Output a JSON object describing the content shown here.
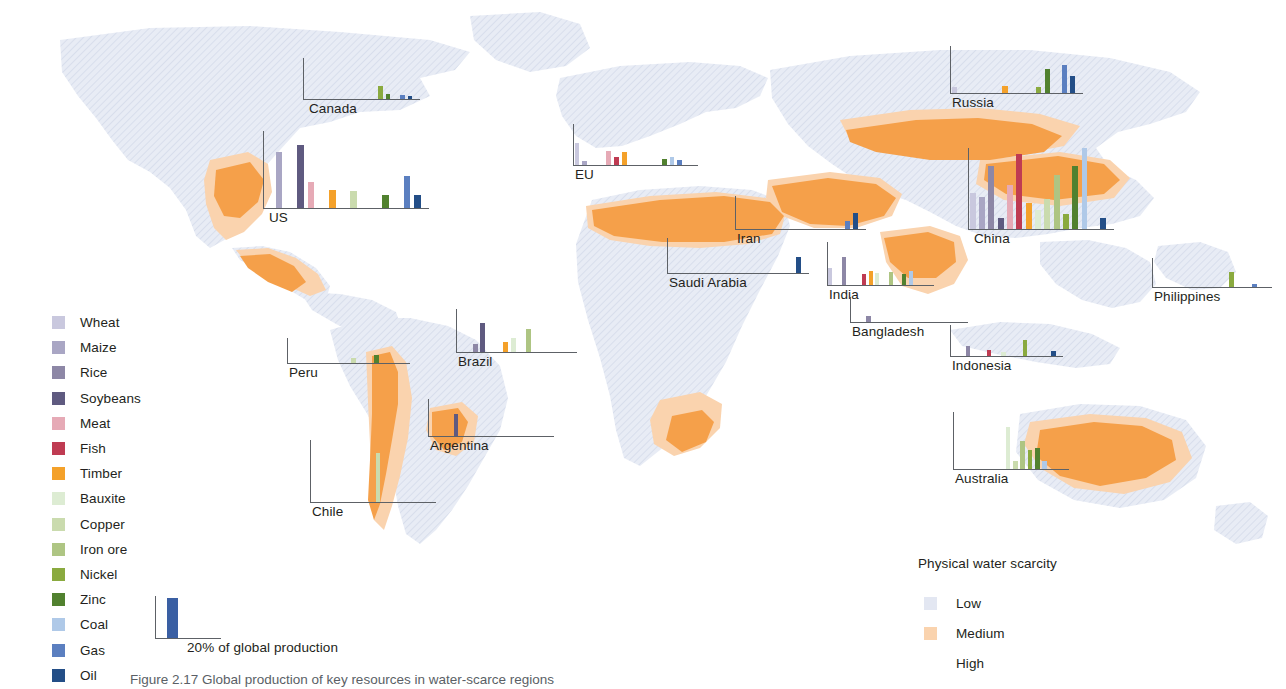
{
  "figure": {
    "caption": "Figure 2.17 Global production of key resources in water-scarce regions",
    "scale_key": {
      "label": "20% of global production",
      "bar_color": "#3a5fa3",
      "value_pct": 20
    }
  },
  "legend_products": {
    "items": [
      {
        "label": "Wheat",
        "color": "#c9c8de"
      },
      {
        "label": "Maize",
        "color": "#a9a6c4"
      },
      {
        "label": "Rice",
        "color": "#8d87a6"
      },
      {
        "label": "Soybeans",
        "color": "#5f5a80"
      },
      {
        "label": "Meat",
        "color": "#e6aab6"
      },
      {
        "label": "Fish",
        "color": "#bf3b52"
      },
      {
        "label": "Timber",
        "color": "#f4a12a"
      },
      {
        "label": "Bauxite",
        "color": "#ddecd3"
      },
      {
        "label": "Copper",
        "color": "#cadbae"
      },
      {
        "label": "Iron ore",
        "color": "#aec583"
      },
      {
        "label": "Nickel",
        "color": "#8aaa3f"
      },
      {
        "label": "Zinc",
        "color": "#51812f"
      },
      {
        "label": "Coal",
        "color": "#afc9e8"
      },
      {
        "label": "Gas",
        "color": "#5b7fc0"
      },
      {
        "label": "Oil",
        "color": "#234e87"
      }
    ]
  },
  "legend_water": {
    "title": "Physical water scarcity",
    "items": [
      {
        "label": "Low",
        "color": "#e3e7f2"
      },
      {
        "label": "Medium",
        "color": "#fad3ae"
      },
      {
        "label": "High",
        "color": "#f5a council"
      }
    ]
  },
  "chart_data": {
    "type": "bar",
    "title": "Global production of key resources in water-scarce regions",
    "unit": "% of global production",
    "categories": [
      "Wheat",
      "Maize",
      "Rice",
      "Soybeans",
      "Meat",
      "Fish",
      "Timber",
      "Bauxite",
      "Copper",
      "Iron ore",
      "Nickel",
      "Zinc",
      "Coal",
      "Gas",
      "Oil"
    ],
    "category_colors": [
      "#c9c8de",
      "#a9a6c4",
      "#8d87a6",
      "#5f5a80",
      "#e6aab6",
      "#bf3b52",
      "#f4a12a",
      "#ddecd3",
      "#cadbae",
      "#aec583",
      "#8aaa3f",
      "#51812f",
      "#afc9e8",
      "#5b7fc0",
      "#234e87"
    ],
    "ylim": [
      0,
      40
    ],
    "scale_reference_pct": 20,
    "panels": [
      {
        "name": "Canada",
        "label": "Canada",
        "x": 303,
        "y": 58,
        "w": 117,
        "h": 42,
        "label_x": 6,
        "label_y": 43,
        "values": [
          0,
          0,
          0,
          0,
          0,
          0,
          0,
          0,
          0,
          0,
          13,
          6,
          0,
          4.5,
          4
        ]
      },
      {
        "name": "US",
        "label": "US",
        "x": 263,
        "y": 131,
        "w": 166,
        "h": 78,
        "label_x": 6,
        "label_y": 79,
        "values": [
          0,
          29,
          0,
          33,
          14,
          0,
          10,
          0,
          9,
          0,
          0,
          7,
          0,
          17,
          7
        ]
      },
      {
        "name": "EU",
        "label": "EU",
        "x": 573,
        "y": 124,
        "w": 125,
        "h": 42,
        "label_x": 2,
        "label_y": 43,
        "values": [
          22,
          5,
          0,
          0,
          14,
          9,
          13,
          0,
          0,
          0,
          0,
          7,
          9,
          6,
          0
        ]
      },
      {
        "name": "Russia",
        "label": "Russia",
        "x": 950,
        "y": 46,
        "w": 133,
        "h": 48,
        "label_x": 2,
        "label_y": 49,
        "values": [
          6,
          0,
          0,
          0,
          0,
          0,
          7,
          0,
          0,
          0,
          6,
          21,
          0,
          24,
          15
        ]
      },
      {
        "name": "China",
        "label": "China",
        "x": 968,
        "y": 148,
        "w": 146,
        "h": 82,
        "label_x": 6,
        "label_y": 83,
        "values": [
          18,
          16,
          31,
          6,
          22,
          37,
          13,
          10,
          15,
          27,
          8,
          31,
          40,
          0,
          6
        ]
      },
      {
        "name": "Iran",
        "label": "Iran",
        "x": 735,
        "y": 196,
        "w": 131,
        "h": 34,
        "label_x": 2,
        "label_y": 35,
        "values": [
          0,
          0,
          0,
          0,
          0,
          0,
          0,
          0,
          0,
          0,
          0,
          0,
          0,
          11,
          20
        ]
      },
      {
        "name": "Saudi Arabia",
        "label": "Saudi Arabia",
        "x": 667,
        "y": 238,
        "w": 142,
        "h": 36,
        "label_x": 2,
        "label_y": 37,
        "values": [
          0,
          0,
          0,
          0,
          0,
          0,
          0,
          0,
          0,
          0,
          0,
          0,
          0,
          0,
          19
        ]
      },
      {
        "name": "India",
        "label": "India",
        "x": 827,
        "y": 242,
        "w": 107,
        "h": 44,
        "label_x": 2,
        "label_y": 45,
        "values": [
          16,
          0,
          26,
          0,
          0,
          11,
          14,
          12,
          0,
          13,
          0,
          11,
          14,
          0,
          0
        ]
      },
      {
        "name": "Bangladesh",
        "label": "Bangladesh",
        "x": 850,
        "y": 297,
        "w": 118,
        "h": 26,
        "label_x": 2,
        "label_y": 27,
        "values": [
          0,
          0,
          11,
          0,
          0,
          0,
          0,
          0,
          0,
          0,
          0,
          0,
          0,
          0,
          0
        ]
      },
      {
        "name": "Philippines",
        "label": "Philippines",
        "x": 1152,
        "y": 258,
        "w": 120,
        "h": 30,
        "label_x": 2,
        "label_y": 31,
        "values": [
          0,
          0,
          0,
          0,
          0,
          0,
          0,
          0,
          0,
          0,
          21,
          0,
          0,
          6,
          0
        ]
      },
      {
        "name": "Indonesia",
        "label": "Indonesia",
        "x": 950,
        "y": 325,
        "w": 113,
        "h": 32,
        "label_x": 2,
        "label_y": 33,
        "values": [
          0,
          0,
          14,
          0,
          0,
          9,
          0,
          6,
          0,
          0,
          21,
          0,
          0,
          0,
          7
        ]
      },
      {
        "name": "Peru",
        "label": "Peru",
        "x": 287,
        "y": 338,
        "w": 123,
        "h": 26,
        "label_x": 2,
        "label_y": 27,
        "values": [
          0,
          0,
          0,
          0,
          0,
          0,
          0,
          0,
          10,
          0,
          0,
          14,
          0,
          0,
          0
        ]
      },
      {
        "name": "Brazil",
        "label": "Brazil",
        "x": 456,
        "y": 309,
        "w": 121,
        "h": 44,
        "label_x": 2,
        "label_y": 45,
        "values": [
          0,
          0,
          8,
          27,
          0,
          0,
          10,
          14,
          0,
          22,
          0,
          0,
          0,
          0,
          0
        ]
      },
      {
        "name": "Argentina",
        "label": "Argentina",
        "x": 428,
        "y": 399,
        "w": 126,
        "h": 38,
        "label_x": 2,
        "label_y": 39,
        "values": [
          0,
          0,
          0,
          24,
          0,
          0,
          0,
          0,
          0,
          0,
          0,
          0,
          0,
          0,
          0
        ]
      },
      {
        "name": "Chile",
        "label": "Chile",
        "x": 310,
        "y": 440,
        "w": 126,
        "h": 63,
        "label_x": 2,
        "label_y": 64,
        "values": [
          0,
          0,
          0,
          0,
          0,
          0,
          0,
          0,
          32,
          0,
          0,
          0,
          0,
          0,
          0
        ]
      },
      {
        "name": "Australia",
        "label": "Australia",
        "x": 953,
        "y": 412,
        "w": 116,
        "h": 58,
        "label_x": 2,
        "label_y": 59,
        "values": [
          0,
          0,
          0,
          0,
          0,
          0,
          0,
          30,
          6,
          20,
          14,
          15,
          6,
          0,
          0
        ]
      }
    ]
  }
}
